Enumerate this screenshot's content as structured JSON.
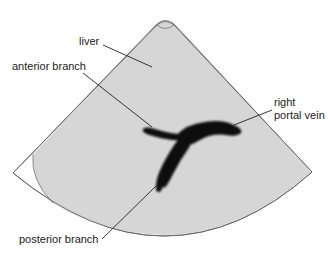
{
  "diagram": {
    "colors": {
      "sector_fill": "#d6d6d6",
      "sector_outline": "#555555",
      "vessel": "#0a0a0a",
      "leader_line": "#222222",
      "background": "#ffffff"
    },
    "labels": {
      "liver": "liver",
      "anterior_branch": "anterior branch",
      "right_portal_vein_line1": "right",
      "right_portal_vein_line2": "portal vein",
      "posterior_branch": "posterior branch"
    }
  }
}
